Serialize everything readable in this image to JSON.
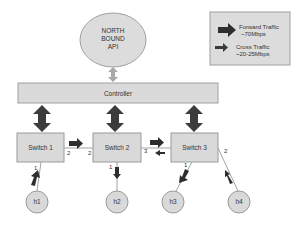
{
  "diagram": {
    "api": {
      "lines": [
        "NORTH",
        "BOUND",
        "API"
      ]
    },
    "controller": {
      "label": "Controller"
    },
    "legend": {
      "forward": {
        "line1": "Forward Traffic",
        "line2": "~70Mbps"
      },
      "cross": {
        "line1": "Cross Traffic",
        "line2": "~20-25Mbps"
      }
    },
    "switches": [
      {
        "label": "Switch 1",
        "ports": {
          "p1": "1",
          "p2": "2"
        }
      },
      {
        "label": "Switch 2",
        "ports": {
          "p1": "1",
          "p2": "2",
          "p3": "3"
        }
      },
      {
        "label": "Switch 3",
        "ports": {
          "p1": "1",
          "p2": "2",
          "p3": "3"
        }
      }
    ],
    "hosts": [
      {
        "label": "h1"
      },
      {
        "label": "h2"
      },
      {
        "label": "h3"
      },
      {
        "label": "h4"
      }
    ],
    "colors": {
      "node_fill": "#d9d9d9",
      "node_stroke": "#9a9a9a",
      "arrow_dark": "#3a3a3a",
      "arrow_light": "#a8a8a8",
      "link": "#8a8a8a"
    }
  }
}
